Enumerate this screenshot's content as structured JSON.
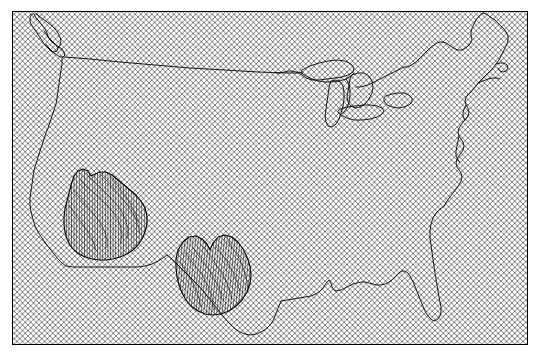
{
  "figure": {
    "title": "",
    "width": 542,
    "height": 356,
    "background_color": "#ffffff"
  },
  "axes": {
    "frame": {
      "x": 12,
      "y": 11,
      "width": 515,
      "height": 333
    },
    "frame_color": "#000000",
    "frame_linewidth": 1.0,
    "face_color": "#ffffff",
    "xticks": [],
    "yticks": [],
    "xlabel": "",
    "ylabel": ""
  },
  "chart_data": {
    "type": "map",
    "title": "",
    "subtitle": "",
    "xlabel": "",
    "ylabel": "",
    "projection": "lambert-conformal-conic",
    "region": "Contiguous United States",
    "grid": false,
    "legend": null,
    "annotations": [],
    "layers": [
      {
        "name": "map-extent-hatch",
        "label": "Map extent",
        "hatch": "xx",
        "hatch_color": "#555555",
        "hatch_spacing_px": 5.5,
        "hatch_linewidth": 0.6,
        "fill_color": "none",
        "edge_color": "#000000"
      },
      {
        "name": "coastline",
        "label": "Coastline / national border",
        "color": "#000000",
        "linewidth": 0.9,
        "fill_color": "none"
      },
      {
        "name": "great-lakes",
        "label": "Great Lakes",
        "color": "#000000",
        "linewidth": 0.9,
        "fill_color": "none"
      },
      {
        "name": "region-west",
        "label": "Western region",
        "hatch": "||||",
        "hatch_color": "#000000",
        "hatch_spacing_px": 2.6,
        "hatch_linewidth": 0.5,
        "fill_color": "none",
        "edge_color": "#000000",
        "edge_linewidth": 1.1
      },
      {
        "name": "region-south-central",
        "label": "South-central region",
        "hatch": "||||",
        "hatch_color": "#000000",
        "hatch_spacing_px": 2.6,
        "hatch_linewidth": 0.5,
        "fill_color": "none",
        "edge_color": "#000000",
        "edge_linewidth": 1.1
      }
    ],
    "geometry": {
      "us_outline": "M 18,43 L 23,37 L 28,33 L 32,30 L 36,30 L 40,34 L 43,39 L 47,45 L 51,48 L 55,52 L 58,57 L 62,61 L 65,63 L 68,65 L 71,68 L 74,71 L 77,74 L 79,78 L 80,82 L 79,86 L 76,88 L 73,89 L 70,90 L 68,92 L 67,96 L 68,100 L 70,103 L 72,106 L 73,110 L 72,114 L 70,118 L 68,122 L 66,127 L 65,133 L 65,140 L 66,148 L 67,156 L 68,164 L 68,172 L 67,180 L 66,188 L 65,196 L 64,204 L 62,212 L 60,219 L 57,225 L 54,231 L 51,237 L 48,243 L 45,249 L 42,255 L 40,261 L 39,268 L 39,275 L 40,282 L 42,289 L 44,296 L 46,303 L 48,310 L 50,317 L 52,323 L 54,329 L 56,334 L 58,339",
      "west_region": "M 74,176 L 78,172 L 83,170 L 88,172 L 92,177 L 96,175 L 101,173 L 107,173 L 113,176 L 118,181 L 124,186 L 130,190 L 136,195 L 141,201 L 145,208 L 147,216 L 147,224 L 145,232 L 142,239 L 138,245 L 133,250 L 127,254 L 120,257 L 113,259 L 106,260 L 99,260 L 92,259 L 85,257 L 79,254 L 74,250 L 70,245 L 67,239 L 65,232 L 64,225 L 64,217 L 65,209 L 67,201 L 69,193 L 71,185 L 74,176 Z",
      "south_region": "M 178,250 L 183,242 L 189,237 L 196,236 L 202,239 L 207,244 L 210,250 L 214,243 L 219,238 L 226,236 L 233,238 L 239,243 L 244,250 L 248,258 L 251,267 L 252,276 L 251,285 L 248,293 L 243,300 L 237,306 L 230,311 L 222,314 L 214,315 L 206,314 L 199,311 L 192,306 L 187,300 L 183,293 L 180,285 L 178,277 L 177,268 L 177,259 L 178,250 Z",
      "great_lakes_count": 5
    }
  },
  "accessibility": {
    "figure_role": "Map of the contiguous United States with hatched map extent and two hatched sub-regions"
  }
}
